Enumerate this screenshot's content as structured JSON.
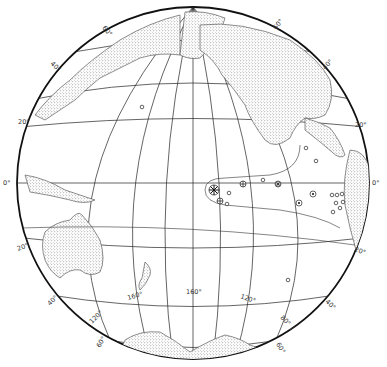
{
  "map": {
    "projection": "orthographic globe centered on the Pacific Ocean",
    "latitude_labels": {
      "left": [
        "60°",
        "40°",
        "20°",
        "0°",
        "20°",
        "40°",
        "60°"
      ],
      "right": [
        "60°",
        "40°",
        "20°",
        "0°",
        "20°",
        "40°",
        "60°"
      ]
    },
    "longitude_labels": [
      "160°",
      "160°",
      "120°",
      "120°",
      "80°"
    ],
    "landmasses": [
      "Asia",
      "Alaska",
      "North America",
      "Central America",
      "South America",
      "Australia",
      "New Zealand",
      "Indonesia",
      "Antarctica"
    ],
    "symbols": {
      "large_asterisk_circle": 1,
      "cross_circle": 3,
      "asterisk_circle": 1,
      "dot_circle": 5,
      "small_circle": 14
    }
  }
}
